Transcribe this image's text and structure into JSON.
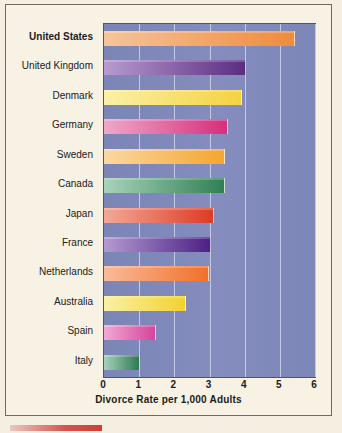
{
  "chart_data": {
    "type": "bar",
    "orientation": "horizontal",
    "title": "",
    "xlabel": "Divorce Rate per 1,000 Adults",
    "ylabel": "",
    "xlim": [
      0,
      6
    ],
    "xticks": [
      0,
      1,
      2,
      3,
      4,
      5,
      6
    ],
    "grid": true,
    "legend": "none",
    "categories": [
      "United States",
      "United Kingdom",
      "Denmark",
      "Germany",
      "Sweden",
      "Canada",
      "Japan",
      "France",
      "Netherlands",
      "Australia",
      "Spain",
      "Italy"
    ],
    "values": [
      5.4,
      4.0,
      3.9,
      3.5,
      3.4,
      3.4,
      3.1,
      3.0,
      2.95,
      2.3,
      1.45,
      1.0
    ],
    "highlight_category": "United States",
    "bar_colors": [
      "#ef8b3c",
      "#5b2d82",
      "#f4d240",
      "#d42f7d",
      "#f5a62e",
      "#2f8055",
      "#dd3b26",
      "#4b2185",
      "#f2702a",
      "#f2d230",
      "#d6449a",
      "#2e7a55"
    ],
    "bar_colors_light": [
      "#f7c49a",
      "#b79bd0",
      "#fbf0a8",
      "#f0a8c8",
      "#fbd8a4",
      "#a9d3bb",
      "#f4a897",
      "#b49ad2",
      "#f9bb9a",
      "#faf0a6",
      "#f0aad4",
      "#a8d2bb"
    ],
    "plot_background": "#7f89b9",
    "figure_background": "#f7f2e4",
    "gridline_color": "#c3cbe2"
  }
}
